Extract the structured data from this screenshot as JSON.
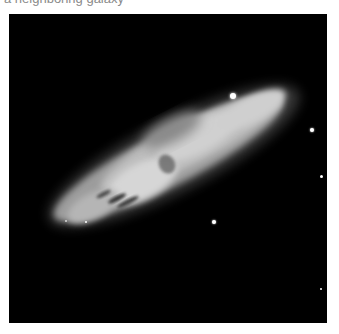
{
  "caption": {
    "text": "a neighboring galaxy"
  },
  "photo": {
    "subject": "edge-on spiral galaxy",
    "background_color": "#000000",
    "galaxy_color": "#d8d8d8",
    "stars": [
      {
        "x": 224,
        "y": 82,
        "r": 3.2
      },
      {
        "x": 303,
        "y": 116,
        "r": 2
      },
      {
        "x": 313,
        "y": 163,
        "r": 1.8
      },
      {
        "x": 205,
        "y": 208,
        "r": 2.2
      },
      {
        "x": 77,
        "y": 208,
        "r": 1.3
      },
      {
        "x": 57,
        "y": 207,
        "r": 1
      },
      {
        "x": 312,
        "y": 275,
        "r": 1.2
      }
    ]
  }
}
